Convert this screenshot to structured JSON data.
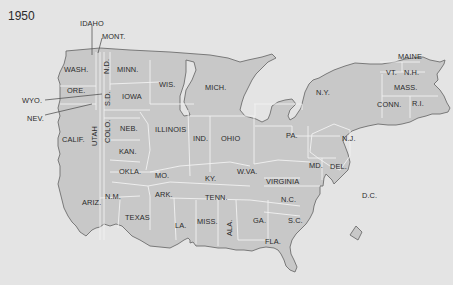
{
  "year": "1950",
  "colors": {
    "background": "#e4e4e4",
    "land": "#c8c8c8",
    "coast": "#6e6e6e",
    "borders": "#f2f2f2",
    "text": "#2a2a2a"
  },
  "states": [
    {
      "id": "idaho",
      "label": "IDAHO"
    },
    {
      "id": "mont",
      "label": "MONT."
    },
    {
      "id": "wash",
      "label": "WASH."
    },
    {
      "id": "nd",
      "label": "N.D."
    },
    {
      "id": "minn",
      "label": "MINN."
    },
    {
      "id": "wis",
      "label": "WIS."
    },
    {
      "id": "mich",
      "label": "MICH."
    },
    {
      "id": "ore",
      "label": "ORE."
    },
    {
      "id": "wyo",
      "label": "WYO."
    },
    {
      "id": "nev",
      "label": "NEV."
    },
    {
      "id": "sd",
      "label": "S.D."
    },
    {
      "id": "iowa",
      "label": "IOWA"
    },
    {
      "id": "calif",
      "label": "CALIF."
    },
    {
      "id": "utah",
      "label": "UTAH"
    },
    {
      "id": "colo",
      "label": "COLO."
    },
    {
      "id": "neb",
      "label": "NEB."
    },
    {
      "id": "kan",
      "label": "KAN."
    },
    {
      "id": "okla",
      "label": "OKLA."
    },
    {
      "id": "illinois",
      "label": "ILLINOIS"
    },
    {
      "id": "ind",
      "label": "IND."
    },
    {
      "id": "ohio",
      "label": "OHIO"
    },
    {
      "id": "mo",
      "label": "MO."
    },
    {
      "id": "ky",
      "label": "KY."
    },
    {
      "id": "wva",
      "label": "W.VA."
    },
    {
      "id": "virginia",
      "label": "VIRGINIA"
    },
    {
      "id": "ark",
      "label": "ARK."
    },
    {
      "id": "tenn",
      "label": "TENN."
    },
    {
      "id": "nc",
      "label": "N.C."
    },
    {
      "id": "nm",
      "label": "N.M."
    },
    {
      "id": "ariz",
      "label": "ARIZ."
    },
    {
      "id": "texas",
      "label": "TEXAS"
    },
    {
      "id": "la",
      "label": "LA."
    },
    {
      "id": "miss",
      "label": "MISS."
    },
    {
      "id": "ala",
      "label": "ALA."
    },
    {
      "id": "ga",
      "label": "GA."
    },
    {
      "id": "sc",
      "label": "S.C."
    },
    {
      "id": "fla",
      "label": "FLA."
    },
    {
      "id": "ny",
      "label": "N.Y."
    },
    {
      "id": "pa",
      "label": "PA."
    },
    {
      "id": "nj",
      "label": "N.J."
    },
    {
      "id": "md",
      "label": "MD."
    },
    {
      "id": "del",
      "label": "DEL."
    },
    {
      "id": "dc",
      "label": "D.C."
    },
    {
      "id": "maine",
      "label": "MAINE"
    },
    {
      "id": "vt",
      "label": "VT."
    },
    {
      "id": "nh",
      "label": "N.H."
    },
    {
      "id": "mass",
      "label": "MASS."
    },
    {
      "id": "conn",
      "label": "CONN."
    },
    {
      "id": "ri",
      "label": "R.I."
    }
  ]
}
